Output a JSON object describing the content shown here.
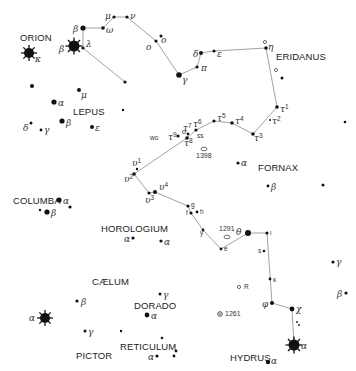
{
  "chart": {
    "width": 356,
    "height": 371,
    "colors": {
      "background": "#ffffff",
      "star": "#111111",
      "line": "#8a8a8a",
      "text": "#222222"
    }
  },
  "constellations": [
    {
      "name": "ORION",
      "x": 20,
      "y": 41
    },
    {
      "name": "LEPUS",
      "x": 73,
      "y": 115
    },
    {
      "name": "ERIDANUS",
      "x": 276,
      "y": 60
    },
    {
      "name": "FORNAX",
      "x": 258,
      "y": 171
    },
    {
      "name": "COLUMBA",
      "x": 13,
      "y": 204
    },
    {
      "name": "HOROLOGIUM",
      "x": 101,
      "y": 232
    },
    {
      "name": "CÆLUM",
      "x": 92,
      "y": 285
    },
    {
      "name": "DORADO",
      "x": 134,
      "y": 309
    },
    {
      "name": "RETICULUM",
      "x": 120,
      "y": 350
    },
    {
      "name": "PICTOR",
      "x": 76,
      "y": 359
    },
    {
      "name": "HYDRUS",
      "x": 230,
      "y": 361
    }
  ],
  "stars": [
    {
      "id": "ori-kappa",
      "x": 29,
      "y": 53,
      "r": 5,
      "bright": true
    },
    {
      "id": "ori-beta",
      "x": 74,
      "y": 46,
      "r": 5.5,
      "bright": true
    },
    {
      "id": "eri-beta",
      "x": 83,
      "y": 28,
      "r": 2.6
    },
    {
      "id": "eri-lambda",
      "x": 83,
      "y": 48,
      "r": 1.6
    },
    {
      "id": "eri-omega",
      "x": 103,
      "y": 28,
      "r": 1.8
    },
    {
      "id": "eri-mu",
      "x": 114,
      "y": 17,
      "r": 1.6
    },
    {
      "id": "eri-nu",
      "x": 127,
      "y": 17,
      "r": 1.6
    },
    {
      "id": "eri-o1",
      "x": 156,
      "y": 41,
      "r": 1.6
    },
    {
      "id": "eri-o2",
      "x": 161,
      "y": 36,
      "r": 1.5
    },
    {
      "id": "eri-gamma",
      "x": 179,
      "y": 75,
      "r": 2.8
    },
    {
      "id": "eri-pi",
      "x": 197,
      "y": 67,
      "r": 1.6
    },
    {
      "id": "eri-delta",
      "x": 201,
      "y": 53,
      "r": 2.0
    },
    {
      "id": "eri-epsilon",
      "x": 214,
      "y": 51,
      "r": 1.6
    },
    {
      "id": "eri-eta",
      "x": 266,
      "y": 48,
      "r": 1.8
    },
    {
      "id": "eri-eta-b",
      "x": 282,
      "y": 78,
      "r": 1.5
    },
    {
      "id": "eri-tau1",
      "x": 277,
      "y": 107,
      "r": 1.8
    },
    {
      "id": "eri-tau2",
      "x": 270,
      "y": 120,
      "r": 1.0
    },
    {
      "id": "eri-tau3",
      "x": 253,
      "y": 134,
      "r": 1.8
    },
    {
      "id": "eri-tau4",
      "x": 232,
      "y": 123,
      "r": 1.8
    },
    {
      "id": "eri-tau5",
      "x": 214,
      "y": 121,
      "r": 1.6
    },
    {
      "id": "eri-tau6",
      "x": 196,
      "y": 130,
      "r": 1.6
    },
    {
      "id": "eri-tau7",
      "x": 188,
      "y": 134,
      "r": 1.4
    },
    {
      "id": "eri-tau8",
      "x": 187,
      "y": 138,
      "r": 1.8
    },
    {
      "id": "eri-tau9",
      "x": 178,
      "y": 136,
      "r": 1.6
    },
    {
      "id": "eri-upsilon1",
      "x": 137,
      "y": 169,
      "r": 1.2
    },
    {
      "id": "eri-upsilon2",
      "x": 134,
      "y": 174,
      "r": 1.8
    },
    {
      "id": "eri-upsilon3",
      "x": 149,
      "y": 193,
      "r": 1.6
    },
    {
      "id": "eri-upsilon4",
      "x": 155,
      "y": 192,
      "r": 2.0
    },
    {
      "id": "eri-g",
      "x": 188,
      "y": 206,
      "r": 1.6
    },
    {
      "id": "eri-f",
      "x": 191,
      "y": 213,
      "r": 1.6
    },
    {
      "id": "eri-h",
      "x": 197,
      "y": 212,
      "r": 1.4
    },
    {
      "id": "eri-y",
      "x": 203,
      "y": 230,
      "r": 1.4
    },
    {
      "id": "eri-e",
      "x": 221,
      "y": 249,
      "r": 1.4
    },
    {
      "id": "eri-theta",
      "x": 248,
      "y": 233,
      "r": 3.0
    },
    {
      "id": "eri-iota",
      "x": 267,
      "y": 233,
      "r": 1.6
    },
    {
      "id": "eri-s",
      "x": 264,
      "y": 251,
      "r": 1.3
    },
    {
      "id": "eri-kappa",
      "x": 270,
      "y": 279,
      "r": 1.4
    },
    {
      "id": "eri-phi",
      "x": 272,
      "y": 303,
      "r": 2.0
    },
    {
      "id": "eri-chi",
      "x": 292,
      "y": 309,
      "r": 2.4
    },
    {
      "id": "eri-chi-b1",
      "x": 297,
      "y": 322,
      "r": 0.9
    },
    {
      "id": "eri-chi-b2",
      "x": 299,
      "y": 325,
      "r": 0.9
    },
    {
      "id": "eri-alpha",
      "x": 294,
      "y": 345,
      "r": 5.5,
      "bright": true
    },
    {
      "id": "hyi-alpha",
      "x": 268,
      "y": 362,
      "r": 2.2
    },
    {
      "id": "lone-1",
      "x": 125,
      "y": 82,
      "r": 1.6
    },
    {
      "id": "lone-2",
      "x": 345,
      "y": 122,
      "r": 1.3
    },
    {
      "id": "lone-3",
      "x": 323,
      "y": 185,
      "r": 1.5
    },
    {
      "id": "lone-4",
      "x": 32,
      "y": 86,
      "r": 2.0
    },
    {
      "id": "lep-mu",
      "x": 79,
      "y": 90,
      "r": 2.0
    },
    {
      "id": "lep-alpha",
      "x": 54,
      "y": 102,
      "r": 2.6
    },
    {
      "id": "lep-beta",
      "x": 62,
      "y": 121,
      "r": 2.6
    },
    {
      "id": "lep-delta",
      "x": 31,
      "y": 123,
      "r": 1.5
    },
    {
      "id": "lep-gamma",
      "x": 41,
      "y": 130,
      "r": 1.4
    },
    {
      "id": "lep-epsilon",
      "x": 92,
      "y": 127,
      "r": 2.0
    },
    {
      "id": "lep-pt",
      "x": 123,
      "y": 110,
      "r": 1.2
    },
    {
      "id": "for-alpha",
      "x": 238,
      "y": 163,
      "r": 1.6
    },
    {
      "id": "for-beta",
      "x": 268,
      "y": 186,
      "r": 1.4
    },
    {
      "id": "col-alpha",
      "x": 59,
      "y": 200,
      "r": 2.6
    },
    {
      "id": "col-beta",
      "x": 47,
      "y": 212,
      "r": 2.6
    },
    {
      "id": "col-c",
      "x": 40,
      "y": 210,
      "r": 1.2
    },
    {
      "id": "col-d",
      "x": 70,
      "y": 207,
      "r": 1.6
    },
    {
      "id": "hor-alpha1",
      "x": 133,
      "y": 238,
      "r": 1.6
    },
    {
      "id": "hor-alpha2",
      "x": 161,
      "y": 241,
      "r": 1.6
    },
    {
      "id": "cae-beta",
      "x": 77,
      "y": 301,
      "r": 1.6
    },
    {
      "id": "cae-alpha",
      "x": 45,
      "y": 318,
      "r": 5,
      "bright": true
    },
    {
      "id": "pic-gamma",
      "x": 85,
      "y": 331,
      "r": 1.5
    },
    {
      "id": "pic-pt",
      "x": 121,
      "y": 331,
      "r": 1.2
    },
    {
      "id": "dor-gamma",
      "x": 160,
      "y": 294,
      "r": 1.5
    },
    {
      "id": "dor-alpha",
      "x": 147,
      "y": 315,
      "r": 2.4
    },
    {
      "id": "ret-pt",
      "x": 162,
      "y": 338,
      "r": 1.3
    },
    {
      "id": "ret-alpha",
      "x": 157,
      "y": 356,
      "r": 1.6
    },
    {
      "id": "ret-b",
      "x": 174,
      "y": 356,
      "r": 1.4
    },
    {
      "id": "ret-c",
      "x": 176,
      "y": 351,
      "r": 1.4
    },
    {
      "id": "hyd-gamma",
      "x": 333,
      "y": 262,
      "r": 1.6
    },
    {
      "id": "hyd-beta",
      "x": 346,
      "y": 293,
      "r": 1.6
    }
  ],
  "lines": [
    {
      "points": [
        [
          83,
          28
        ],
        [
          103,
          28
        ]
      ]
    },
    {
      "points": [
        [
          83,
          28
        ],
        [
          83,
          48
        ],
        [
          125,
          82
        ]
      ]
    },
    {
      "points": [
        [
          114,
          17
        ],
        [
          127,
          17
        ],
        [
          156,
          41
        ],
        [
          179,
          75
        ],
        [
          197,
          67
        ],
        [
          201,
          53
        ],
        [
          214,
          51
        ],
        [
          266,
          48
        ],
        [
          277,
          107
        ],
        [
          253,
          134
        ],
        [
          232,
          123
        ],
        [
          214,
          121
        ],
        [
          196,
          130
        ],
        [
          187,
          138
        ],
        [
          134,
          174
        ],
        [
          149,
          193
        ],
        [
          155,
          192
        ],
        [
          188,
          206
        ],
        [
          191,
          213
        ],
        [
          203,
          230
        ],
        [
          221,
          249
        ],
        [
          248,
          233
        ],
        [
          267,
          233
        ],
        [
          272,
          303
        ],
        [
          292,
          309
        ],
        [
          294,
          345
        ]
      ]
    },
    {
      "points": [
        [
          103,
          28
        ],
        [
          114,
          17
        ]
      ]
    }
  ],
  "greek_labels": [
    {
      "text": "κ",
      "x": 35,
      "y": 62
    },
    {
      "text": "β",
      "x": 59,
      "y": 52
    },
    {
      "text": "β",
      "x": 73,
      "y": 32
    },
    {
      "text": "λ",
      "x": 86,
      "y": 47
    },
    {
      "text": "ω",
      "x": 106,
      "y": 33
    },
    {
      "text": "μ",
      "x": 105,
      "y": 19
    },
    {
      "text": "ν",
      "x": 130,
      "y": 19
    },
    {
      "text": "ο",
      "x": 146,
      "y": 50
    },
    {
      "text": "ο",
      "x": 161,
      "y": 43
    },
    {
      "text": "γ",
      "x": 182,
      "y": 83
    },
    {
      "text": "π",
      "x": 201,
      "y": 71
    },
    {
      "text": "δ",
      "x": 193,
      "y": 57
    },
    {
      "text": "ε",
      "x": 217,
      "y": 57
    },
    {
      "text": "η",
      "x": 268,
      "y": 50
    },
    {
      "text": "μ",
      "x": 81,
      "y": 98
    },
    {
      "text": "α",
      "x": 58,
      "y": 106
    },
    {
      "text": "β",
      "x": 66,
      "y": 126
    },
    {
      "text": "δ",
      "x": 23,
      "y": 131
    },
    {
      "text": "γ",
      "x": 44,
      "y": 133
    },
    {
      "text": "ε",
      "x": 95,
      "y": 131
    },
    {
      "text": "α",
      "x": 241,
      "y": 166
    },
    {
      "text": "β",
      "x": 271,
      "y": 190
    },
    {
      "text": "α",
      "x": 63,
      "y": 204
    },
    {
      "text": "β",
      "x": 51,
      "y": 216
    },
    {
      "text": "α",
      "x": 124,
      "y": 242
    },
    {
      "text": "α",
      "x": 164,
      "y": 245
    },
    {
      "text": "β",
      "x": 81,
      "y": 305
    },
    {
      "text": "α",
      "x": 29,
      "y": 321
    },
    {
      "text": "γ",
      "x": 88,
      "y": 335
    },
    {
      "text": "γ",
      "x": 163,
      "y": 298
    },
    {
      "text": "α",
      "x": 151,
      "y": 319
    },
    {
      "text": "α",
      "x": 148,
      "y": 360
    },
    {
      "text": "θ",
      "x": 236,
      "y": 235
    },
    {
      "text": "φ",
      "x": 262,
      "y": 307
    },
    {
      "text": "χ",
      "x": 296,
      "y": 312
    },
    {
      "text": "α",
      "x": 301,
      "y": 349
    },
    {
      "text": "α",
      "x": 271,
      "y": 364
    },
    {
      "text": "γ",
      "x": 336,
      "y": 265
    },
    {
      "text": "β",
      "x": 337,
      "y": 297
    }
  ],
  "designation_labels": [
    {
      "text": "τ1",
      "x": 280,
      "y": 112
    },
    {
      "text": "τ2",
      "x": 272,
      "y": 124
    },
    {
      "text": "τ3",
      "x": 254,
      "y": 141
    },
    {
      "text": "τ4",
      "x": 235,
      "y": 124
    },
    {
      "text": "τ5",
      "x": 217,
      "y": 121
    },
    {
      "text": "τ6",
      "x": 193,
      "y": 127
    },
    {
      "text": "τ7",
      "x": 183,
      "y": 131
    },
    {
      "text": "τ8",
      "x": 184,
      "y": 146
    },
    {
      "text": "τ9",
      "x": 168,
      "y": 140
    },
    {
      "text": "υ1",
      "x": 132,
      "y": 166
    },
    {
      "text": "υ2",
      "x": 124,
      "y": 182
    },
    {
      "text": "υ3",
      "x": 145,
      "y": 203
    },
    {
      "text": "υ4",
      "x": 159,
      "y": 190
    }
  ],
  "small_labels": [
    {
      "text": "wo",
      "x": 150,
      "y": 140
    },
    {
      "text": "ss",
      "x": 197,
      "y": 138
    },
    {
      "text": "g",
      "x": 191,
      "y": 207
    },
    {
      "text": "f",
      "x": 186,
      "y": 215
    },
    {
      "text": "h",
      "x": 200,
      "y": 214
    },
    {
      "text": "y",
      "x": 200,
      "y": 235
    },
    {
      "text": "e",
      "x": 224,
      "y": 251
    },
    {
      "text": "ι",
      "x": 270,
      "y": 235
    },
    {
      "text": "s",
      "x": 258,
      "y": 253
    },
    {
      "text": "κ",
      "x": 273,
      "y": 282
    },
    {
      "text": "R",
      "x": 244,
      "y": 289
    }
  ],
  "deep_sky": [
    {
      "label": "1398",
      "x": 204,
      "y": 149,
      "lx": 196,
      "ly": 158,
      "type": "galaxy"
    },
    {
      "label": "1291",
      "x": 227,
      "y": 237,
      "lx": 219,
      "ly": 231,
      "type": "cluster"
    },
    {
      "label": "1261",
      "x": 220,
      "y": 314,
      "lx": 225,
      "ly": 316,
      "type": "globular"
    },
    {
      "label": "",
      "x": 239,
      "y": 287,
      "type": "small-circle"
    },
    {
      "label": "",
      "x": 265,
      "y": 42,
      "type": "small-circle"
    },
    {
      "label": "",
      "x": 276,
      "y": 70,
      "type": "small-circle"
    },
    {
      "label": "",
      "x": 184,
      "y": 132,
      "type": "small-circle"
    }
  ]
}
